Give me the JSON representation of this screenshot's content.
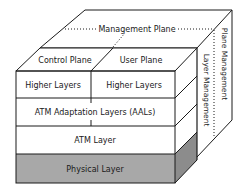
{
  "diagram": {
    "management_plane": "Management Plane",
    "control_plane": "Control Plane",
    "user_plane": "User Plane",
    "plane_management": "Plane Management",
    "layer_management": "Layer Management",
    "layers": [
      {
        "label": "Higher Layers",
        "side": "left"
      },
      {
        "label": "Higher Layers",
        "side": "right"
      },
      {
        "label": "ATM Adaptation Layers (AALs)"
      },
      {
        "label": "ATM Layer"
      },
      {
        "label": "Physical Layer"
      }
    ],
    "colors": {
      "line": "#1a1a1a",
      "physical_fill": "#a8a8a8",
      "physical_side_fill": "#8c8c8c",
      "face_fill": "#ffffff"
    }
  }
}
